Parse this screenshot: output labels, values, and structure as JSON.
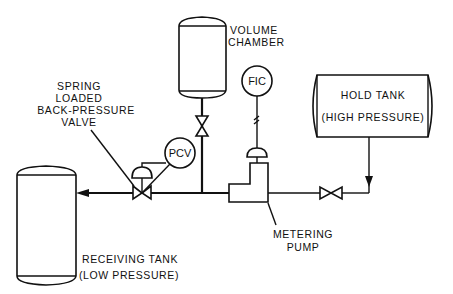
{
  "diagram": {
    "type": "process-flow-schematic",
    "components": {
      "volume_chamber": {
        "label_line1": "VOLUME",
        "label_line2": "CHAMBER"
      },
      "fic": {
        "label": "FIC"
      },
      "pcv": {
        "label": "PCV"
      },
      "hold_tank": {
        "label_line1": "HOLD TANK",
        "label_line2": "(HIGH PRESSURE)"
      },
      "back_pressure_valve": {
        "label_line1": "SPRING",
        "label_line2": "LOADED",
        "label_line3": "BACK-PRESSURE",
        "label_line4": "VALVE"
      },
      "metering_pump": {
        "label_line1": "METERING",
        "label_line2": "PUMP"
      },
      "receiving_tank": {
        "label_line1": "RECEIVING TANK",
        "label_line2": "(LOW PRESSURE)"
      }
    },
    "flow_direction": "Hold Tank → Valve → Metering Pump → Back-Pressure Valve → Receiving Tank"
  }
}
